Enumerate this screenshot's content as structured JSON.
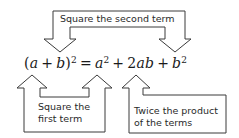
{
  "diagram": {
    "equation": {
      "lhs_open": "(",
      "lhs_a": "a",
      "lhs_plus": "+",
      "lhs_b": "b",
      "lhs_close": ")",
      "lhs_exp": "2",
      "equals": "=",
      "t1_var": "a",
      "t1_exp": "2",
      "plus1": "+",
      "t2_coef": "2",
      "t2_vars": "ab",
      "plus2": "+",
      "t3_var": "b",
      "t3_exp": "2"
    },
    "callouts": {
      "top": "Square the second term",
      "bottom_left_line1": "Square the",
      "bottom_left_line2": "first term",
      "bottom_right_line1": "Twice the product",
      "bottom_right_line2": "of the terms"
    },
    "colors": {
      "stroke": "#3a3a3a",
      "text": "#1a1a1a",
      "background": "#ffffff"
    }
  }
}
